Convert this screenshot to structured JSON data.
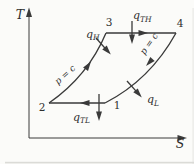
{
  "figure": {
    "kind": "temperature-entropy cycle diagram",
    "colors": {
      "ink": "#3a3a3a",
      "background": "#fbfbf9"
    },
    "axes": {
      "y_label": "T",
      "x_label": "S"
    },
    "state_points": [
      {
        "label": "1"
      },
      {
        "label": "2"
      },
      {
        "label": "3"
      },
      {
        "label": "4"
      }
    ],
    "process_labels": {
      "left_isobar": "p = c",
      "right_isobar": "p = c"
    },
    "heat_flows": {
      "qH": {
        "base": "q",
        "sub": "H"
      },
      "qTH": {
        "base": "q",
        "sub": "TH"
      },
      "qL": {
        "base": "q",
        "sub": "L"
      },
      "qTL": {
        "base": "q",
        "sub": "TL"
      }
    }
  }
}
